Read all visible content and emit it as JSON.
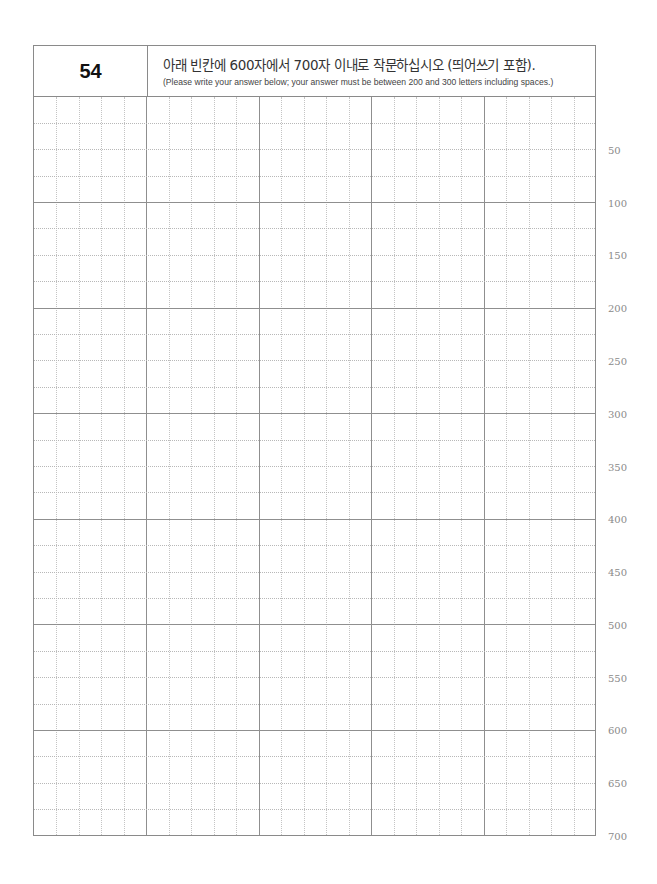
{
  "question": {
    "number": "54",
    "instruction_ko": "아래 빈칸에 600자에서 700자 이내로 작문하십시오 (띄어쓰기 포함).",
    "instruction_en": "(Please write your answer below; your answer must be between 200 and 300 letters including spaces.)"
  },
  "answer_grid": {
    "columns": 25,
    "rows": 28,
    "major_column_every": 5,
    "major_row_every": 4,
    "content": ""
  },
  "character_counts": [
    "50",
    "100",
    "150",
    "200",
    "250",
    "300",
    "350",
    "400",
    "450",
    "500",
    "550",
    "600",
    "650",
    "700"
  ],
  "colors": {
    "major_line": "#8f8f8f",
    "minor_line": "#c4c4c4",
    "count_label": "#8a8a8a"
  }
}
